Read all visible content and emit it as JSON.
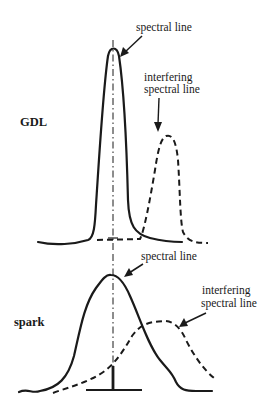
{
  "figure": {
    "panels": [
      {
        "name": "GDL",
        "label": "GDL",
        "spectral_line_label": "spectral line",
        "interfering_label_line1": "interfering",
        "interfering_label_line2": "spectral line"
      },
      {
        "name": "spark",
        "label": "spark",
        "spectral_line_label": "spectral line",
        "interfering_label_line1": "interfering",
        "interfering_label_line2": "spectral line"
      }
    ],
    "colors": {
      "ink": "#1a1a1a",
      "background": "#ffffff"
    }
  }
}
